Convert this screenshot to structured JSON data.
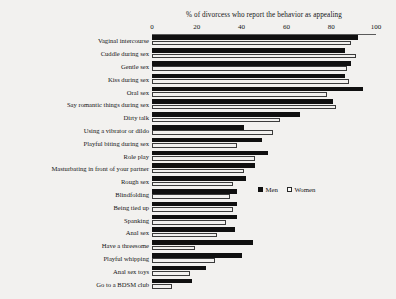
{
  "chart_data": {
    "type": "bar",
    "orientation": "horizontal",
    "title": "% of divorcess who report the behavior as appealing",
    "xlabel": "",
    "ylabel": "",
    "xlim": [
      0,
      100
    ],
    "xticks": [
      0,
      20,
      40,
      60,
      80,
      100
    ],
    "grid": false,
    "legend_position": "middle-right",
    "categories": [
      "Vaginal intercourse",
      "Cuddle during sex",
      "Gentle sex",
      "Kiss during sex",
      "Oral sex",
      "Say romantic things during sex",
      "Dirty talk",
      "Using a vibrator or dildo",
      "Playful biting during sex",
      "Role play",
      "Masturbating in front of your partner",
      "Rough sex",
      "Blindfolding",
      "Being tied up",
      "Spanking",
      "Anal sex",
      "Have a threesome",
      "Playful whipping",
      "Anal sex toys",
      "Go to a BDSM club"
    ],
    "series": [
      {
        "name": "Men",
        "color": "#101010",
        "values": [
          92,
          86,
          89,
          86,
          94,
          81,
          66,
          41,
          49,
          52,
          46,
          42,
          38,
          38,
          38,
          37,
          45,
          40,
          24,
          18
        ]
      },
      {
        "name": "Women",
        "color": "#ffffff",
        "values": [
          89,
          91,
          87,
          88,
          78,
          82,
          57,
          54,
          38,
          46,
          41,
          36,
          35,
          36,
          33,
          29,
          19,
          28,
          17,
          9
        ]
      }
    ]
  },
  "legend": {
    "men_label": "Men",
    "women_label": "Women"
  }
}
